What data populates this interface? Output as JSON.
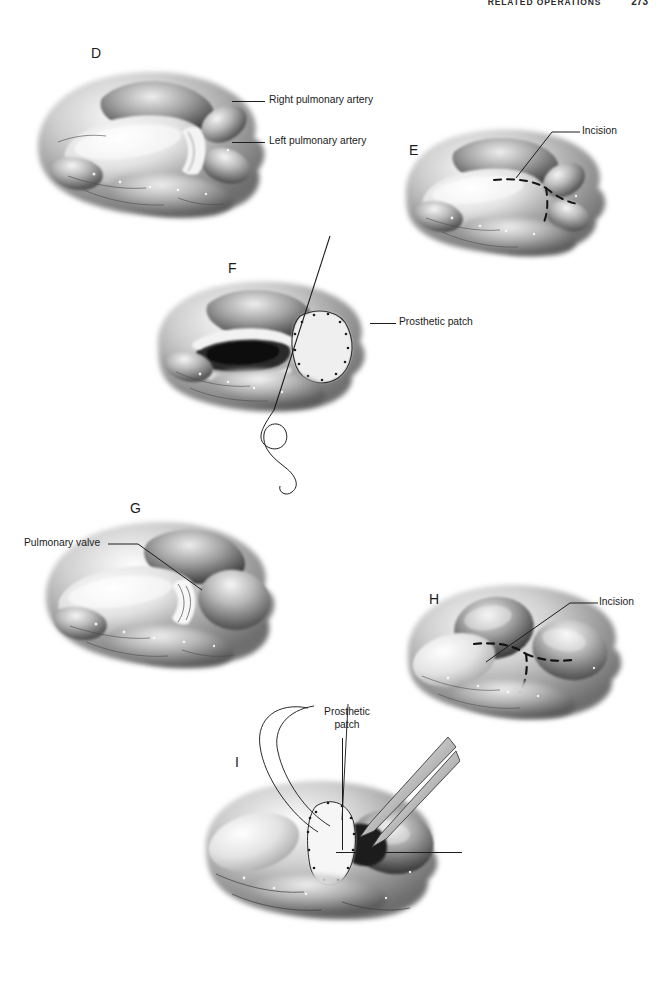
{
  "page": {
    "running_head": "RELATED OPERATIONS",
    "folio": "273",
    "background_color": "#ffffff",
    "ink_color": "#1b1b1b"
  },
  "figure": {
    "medium": "grayscale airbrush medical illustration",
    "panels": [
      {
        "letter": "D",
        "letter_x": 91,
        "letter_y": 46,
        "view": "anterior view of great vessels showing bifurcation of the main pulmonary artery",
        "labels": [
          {
            "text": "Right pulmonary artery",
            "x": 269,
            "y": 94,
            "leader": {
              "type": "h",
              "x": 232,
              "y": 101,
              "length": 33
            }
          },
          {
            "text": "Left pulmonary artery",
            "x": 269,
            "y": 135,
            "leader": {
              "type": "h",
              "x": 232,
              "y": 142,
              "length": 33
            }
          }
        ]
      },
      {
        "letter": "E",
        "letter_x": 409,
        "letter_y": 143,
        "view": "planned incision marked by dashed line across the arteriotomy site",
        "labels": [
          {
            "text": "Incision",
            "x": 582,
            "y": 125,
            "leader": {
              "type": "h",
              "x": 552,
              "y": 132,
              "length": 26
            }
          }
        ]
      },
      {
        "letter": "F",
        "letter_x": 228,
        "letter_y": 261,
        "view": "arteriotomy opened with prosthetic patch being sutured in place",
        "labels": [
          {
            "text": "Prosthetic patch",
            "x": 399,
            "y": 316,
            "leader": {
              "type": "h",
              "x": 370,
              "y": 323,
              "length": 26
            }
          }
        ]
      },
      {
        "letter": "G",
        "letter_x": 130,
        "letter_y": 501,
        "view": "exposure of the pulmonary valve and main pulmonary artery",
        "labels": [
          {
            "text": "Pulmonary valve",
            "x": 24,
            "y": 537,
            "leader": {
              "type": "h",
              "x": 110,
              "y": 544,
              "length": 28
            }
          }
        ]
      },
      {
        "letter": "H",
        "letter_x": 429,
        "letter_y": 592,
        "view": "dashed incision line extending across the valve annulus",
        "labels": [
          {
            "text": "Incision",
            "x": 599,
            "y": 596,
            "leader": {
              "type": "h",
              "x": 569,
              "y": 603,
              "length": 26
            }
          }
        ]
      },
      {
        "letter": "I",
        "letter_x": 235,
        "letter_y": 755,
        "view": "transannular prosthetic patch held with forceps while suture line is completed",
        "labels": [
          {
            "text": "Prosthetic patch",
            "x": 311,
            "y": 706,
            "two_line": true,
            "leader": {
              "type": "v",
              "x": 342,
              "y": 738,
              "length": 112
            }
          }
        ]
      }
    ]
  }
}
